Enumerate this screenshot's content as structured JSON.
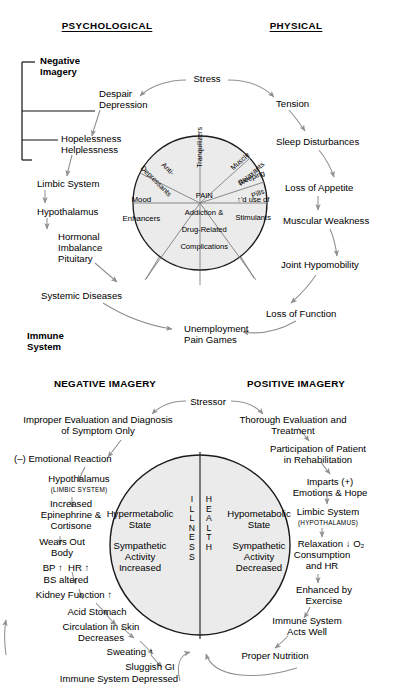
{
  "figure": {
    "top": {
      "headers": {
        "left": "PSYCHOLOGICAL",
        "right": "PHYSICAL"
      },
      "bracket": {
        "top_label_line1": "Negative",
        "top_label_line2": "Imagery",
        "bottom_label_line1": "Immune",
        "bottom_label_line2": "System"
      },
      "left_chain": [
        {
          "id": "despair",
          "line1": "Despair",
          "line2": "Depression"
        },
        {
          "id": "hopeless",
          "line1": "Hopelessness",
          "line2": "Helplessness"
        },
        {
          "id": "limbic",
          "line1": "Limbic System",
          "line2": ""
        },
        {
          "id": "hypothal",
          "line1": "Hypothalamus",
          "line2": ""
        },
        {
          "id": "hormonal",
          "line1": "Hormonal",
          "line2": "Imbalance",
          "line3": "Pituitary"
        },
        {
          "id": "systemic",
          "line1": "Systemic Diseases",
          "line2": ""
        }
      ],
      "right_chain": [
        {
          "id": "tension",
          "label": "Tension"
        },
        {
          "id": "sleep",
          "label": "Sleep Disturbances"
        },
        {
          "id": "appetite",
          "label": "Loss of Appetite"
        },
        {
          "id": "muscular",
          "label": "Muscular Weakness"
        },
        {
          "id": "joint",
          "label": "Joint Hypomobility"
        },
        {
          "id": "function",
          "label": "Loss of Function"
        }
      ],
      "stress_label": "Stress",
      "outcome": {
        "line1": "Unemployment",
        "line2": "Pain Games"
      },
      "circle": {
        "center": {
          "line1": "PAIN",
          "line2": "Addiction &",
          "line3": "Drug-Related",
          "line4": "Complications"
        },
        "spokes": [
          {
            "id": "anti-depressants",
            "line1": "Anti-",
            "line2": "Depressants"
          },
          {
            "id": "tranquilizers",
            "line1": "Tranquilizers",
            "line2": ""
          },
          {
            "id": "muscle-relaxants",
            "line1": "Muscle",
            "line2": "Relaxants"
          },
          {
            "id": "sleeping-pills",
            "line1": "Sleeping",
            "line2": "Pills"
          },
          {
            "id": "stimulants",
            "line1": "↑'d use of",
            "line2": "Stimulants"
          },
          {
            "id": "mood-enhancers",
            "line1": "Mood",
            "line2": "Enhancers"
          }
        ]
      }
    },
    "bottom": {
      "headers": {
        "left": "NEGATIVE IMAGERY",
        "right": "POSITIVE IMAGERY"
      },
      "stressor_label": "Stressor",
      "center_words": {
        "left": "ILLNESS",
        "right": "HEALTH"
      },
      "pie_left": {
        "line1": "Hypermetabolic",
        "line2": "State",
        "line3": "Sympathetic",
        "line4": "Activity",
        "line5": "Increased"
      },
      "pie_right": {
        "line1": "Hypometabolic",
        "line2": "State",
        "line3": "Sympathetic",
        "line4": "Activity",
        "line5": "Decreased"
      },
      "left_chain": [
        {
          "id": "improper-eval",
          "line1": "Improper Evaluation and Diagnosis",
          "line2": "of Symptom Only"
        },
        {
          "id": "emotional-reaction",
          "line1": "(–) Emotional Reaction",
          "line2": ""
        },
        {
          "id": "hypothalamus",
          "line1": "Hypothalamus",
          "line2": "(LIMBIC SYSTEM)"
        },
        {
          "id": "epinephrine",
          "line1": "Increased",
          "line2": "Epinephrine &",
          "line3": "Cortisone"
        },
        {
          "id": "wears-out",
          "line1": "Wears Out",
          "line2": "Body"
        },
        {
          "id": "bp-hr",
          "line1": "BP ↑  HR ↑",
          "line2": "BS altered"
        },
        {
          "id": "kidney",
          "line1": "Kidney Function ↑",
          "line2": ""
        },
        {
          "id": "acid-stomach",
          "line1": "Acid Stomach",
          "line2": ""
        },
        {
          "id": "circulation",
          "line1": "Circulation in Skin",
          "line2": "Decreases"
        },
        {
          "id": "sweating",
          "line1": "Sweating ↑",
          "line2": ""
        },
        {
          "id": "sluggish-gi",
          "line1": "Sluggish GI",
          "line2": ""
        },
        {
          "id": "immune-depressed",
          "line1": "Immune System Depressed",
          "line2": ""
        }
      ],
      "right_chain": [
        {
          "id": "thorough-eval",
          "line1": "Thorough Evaluation and",
          "line2": "Treatment"
        },
        {
          "id": "participation",
          "line1": "Participation of Patient",
          "line2": "in Rehabilitation"
        },
        {
          "id": "imparts",
          "line1": "Imparts (+)",
          "line2": "Emotions & Hope"
        },
        {
          "id": "limbic-system",
          "line1": "Limbic System",
          "line2": "(HYPOTHALAMUS)"
        },
        {
          "id": "relaxation",
          "line1": "Relaxation ↓ O₂",
          "line2": "Consumption",
          "line3": "and HR"
        },
        {
          "id": "exercise",
          "line1": "Enhanced by",
          "line2": "Exercise"
        },
        {
          "id": "immune-well",
          "line1": "Immune System",
          "line2": "Acts Well"
        },
        {
          "id": "nutrition",
          "line1": "Proper Nutrition",
          "line2": ""
        }
      ]
    }
  },
  "colors": {
    "ink": "#000000",
    "arrow": "#8f8f8f",
    "pie_fill": "#ebebeb",
    "circle_stroke": "#1a1a1a"
  }
}
